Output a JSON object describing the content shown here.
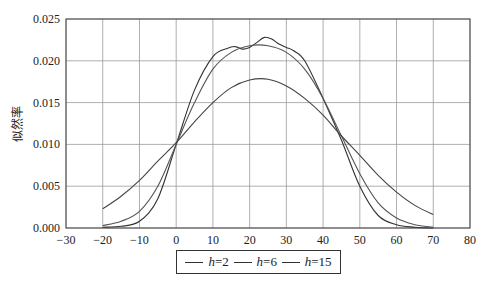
{
  "chart_data": {
    "type": "line",
    "title": "",
    "xlabel": "",
    "ylabel": "似然率",
    "xlim": [
      -30,
      80
    ],
    "ylim": [
      0.0,
      0.025
    ],
    "xticks": [
      -30,
      -20,
      -10,
      0,
      10,
      20,
      30,
      40,
      50,
      60,
      70,
      80
    ],
    "yticks": [
      0.0,
      0.005,
      0.01,
      0.015,
      0.02,
      0.025
    ],
    "ytick_labels": [
      "0.000",
      "0.005",
      "0.010",
      "0.015",
      "0.020",
      "0.025"
    ],
    "grid": true,
    "legend_position": "bottom-center",
    "series": [
      {
        "name": "h=2",
        "color": "#333333",
        "x": [
          -20,
          -15,
          -10,
          -5,
          0,
          5,
          10,
          14,
          16,
          18,
          20,
          22,
          24,
          26,
          28,
          30,
          32,
          35,
          40,
          45,
          50,
          55,
          60,
          65,
          70
        ],
        "values": [
          0.0001,
          0.0002,
          0.0008,
          0.0035,
          0.01,
          0.0165,
          0.0205,
          0.0215,
          0.0217,
          0.0214,
          0.0216,
          0.0222,
          0.0228,
          0.0226,
          0.022,
          0.0216,
          0.0212,
          0.02,
          0.0155,
          0.0105,
          0.005,
          0.0015,
          0.0004,
          0.0001,
          0.0
        ]
      },
      {
        "name": "h=6",
        "color": "#555555",
        "x": [
          -20,
          -15,
          -10,
          -5,
          0,
          5,
          10,
          15,
          20,
          25,
          30,
          35,
          40,
          45,
          50,
          55,
          60,
          65,
          70
        ],
        "values": [
          0.0003,
          0.0008,
          0.002,
          0.005,
          0.01,
          0.015,
          0.019,
          0.021,
          0.0218,
          0.0218,
          0.021,
          0.019,
          0.0155,
          0.011,
          0.0065,
          0.003,
          0.0012,
          0.0004,
          0.0001
        ]
      },
      {
        "name": "h=15",
        "color": "#444444",
        "x": [
          -20,
          -15,
          -10,
          -5,
          0,
          5,
          10,
          15,
          20,
          25,
          30,
          35,
          40,
          45,
          50,
          55,
          60,
          65,
          70
        ],
        "values": [
          0.0023,
          0.0038,
          0.0057,
          0.008,
          0.0102,
          0.0127,
          0.015,
          0.0168,
          0.0177,
          0.0178,
          0.017,
          0.0155,
          0.0135,
          0.011,
          0.0087,
          0.0063,
          0.0043,
          0.0027,
          0.0016
        ]
      }
    ]
  },
  "legend": {
    "items": [
      {
        "var": "h",
        "suffix": "=2"
      },
      {
        "var": "h",
        "suffix": "=6"
      },
      {
        "var": "h",
        "suffix": "=15"
      }
    ]
  }
}
